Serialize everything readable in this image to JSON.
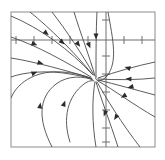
{
  "figure": {
    "caption": "",
    "background_color": "#ffffff",
    "line_color": "#4a4a4a",
    "axis_color": "#6e6e6e",
    "frame_color": "#8c8c8c"
  },
  "chart_data": {
    "type": "line",
    "subtitle": "",
    "xlabel": "",
    "ylabel": "",
    "xlim": [
      -5,
      4
    ],
    "ylim": [
      -6,
      2
    ],
    "grid": false,
    "legend": null,
    "legend_position": "none",
    "tick_labels_x": [],
    "tick_labels_y": [],
    "axes": {
      "x_axis_y_value": 0,
      "y_axis_x_value": 0,
      "x_tick_spacing": 1,
      "y_tick_spacing": 1,
      "x_tick_count": 9,
      "y_tick_count": 8
    },
    "equilibrium_point": {
      "x": -0.75,
      "y": -1.6,
      "classification": "attracting node / spiral"
    },
    "frame": {
      "left_px": 11,
      "top_px": 12,
      "right_px": 155,
      "bottom_px": 147
    },
    "axis_pixels": {
      "x_axis_y_px": 40,
      "y_axis_x_px": 106,
      "x_ticks_px": [
        16,
        34,
        52,
        70,
        88,
        124,
        142
      ],
      "y_ticks_px": [
        20,
        56,
        74,
        92,
        110,
        128,
        142
      ]
    },
    "series": [
      {
        "name": "trajectory-1",
        "path_px": "M 11,16 C 40,28 70,50 92,74",
        "arrows_px": [
          [
            46,
            33,
            40
          ]
        ]
      },
      {
        "name": "trajectory-2",
        "path_px": "M 30,12 C 50,28 74,52 93,75",
        "arrows_px": [
          [
            62,
            42,
            42
          ]
        ]
      },
      {
        "name": "trajectory-3",
        "path_px": "M 52,12 C 66,30 82,54 94,75",
        "arrows_px": [
          [
            78,
            44,
            52
          ]
        ]
      },
      {
        "name": "trajectory-4",
        "path_px": "M 74,12 C 80,32 90,58 95,76",
        "arrows_px": [
          [
            89,
            45,
            68
          ]
        ]
      },
      {
        "name": "trajectory-5",
        "path_px": "M 97,12 C 96,30 96,56 96,77",
        "arrows_px": [
          [
            96,
            36,
            90
          ]
        ]
      },
      {
        "name": "trajectory-6",
        "path_px": "M 108,12 C 113,40 118,62 107,76 C 100,84 94,80 96,77",
        "arrows_px": []
      },
      {
        "name": "trajectory-7",
        "path_px": "M 155,62 C 136,66 115,72 98,78",
        "arrows_px": [
          [
            128,
            68,
            197
          ]
        ]
      },
      {
        "name": "trajectory-8",
        "path_px": "M 155,78 C 138,80 116,80 98,79",
        "arrows_px": [
          [
            129,
            79,
            183
          ]
        ]
      },
      {
        "name": "trajectory-9",
        "path_px": "M 155,95 C 136,90 115,84 98,80",
        "arrows_px": [
          [
            131,
            87,
            166
          ]
        ]
      },
      {
        "name": "trajectory-10",
        "path_px": "M 155,117 C 134,105 114,90 98,81",
        "arrows_px": [
          [
            124,
            96,
            149
          ]
        ]
      },
      {
        "name": "trajectory-11",
        "path_px": "M 140,147 C 122,124 106,98 97,82",
        "arrows_px": [
          [
            116,
            117,
            123
          ]
        ]
      },
      {
        "name": "trajectory-12",
        "path_px": "M 118,147 C 110,122 100,96 96,82",
        "arrows_px": [
          [
            105,
            113,
            110
          ]
        ]
      },
      {
        "name": "trajectory-13",
        "path_px": "M 96,147 C 92,124 92,98 95,82",
        "arrows_px": []
      },
      {
        "name": "trajectory-14",
        "path_px": "M 70,142 C 62,118 68,96 84,84 C 88,81 92,80 94,81",
        "arrows_px": [
          [
            64,
            104,
            290
          ]
        ]
      },
      {
        "name": "trajectory-15",
        "path_px": "M 52,147 C 38,120 38,98 56,84 C 68,75 84,76 93,80",
        "arrows_px": [
          [
            40,
            106,
            278
          ]
        ]
      },
      {
        "name": "trajectory-16",
        "path_px": "M 11,98 C 18,80 40,70 62,72 C 78,73 88,77 92,79",
        "arrows_px": [
          [
            34,
            73,
            340
          ]
        ]
      },
      {
        "name": "trajectory-17",
        "path_px": "M 11,58 C 36,62 64,70 91,78",
        "arrows_px": [
          [
            40,
            63,
            16
          ]
        ]
      },
      {
        "name": "trajectory-18",
        "path_px": "M 11,37 C 38,46 66,62 91,77",
        "arrows_px": [
          [
            34,
            44,
            22
          ]
        ]
      },
      {
        "name": "trajectory-19",
        "path_px": "M 11,77 C 24,72 48,70 70,74 C 82,76 89,78 92,79",
        "arrows_px": []
      }
    ]
  },
  "a11y": {
    "figure_role_label": "phase portrait plot",
    "description": "Phase plane diagram with a horizontal and vertical axis crossing near the upper right; many smooth trajectory curves with small triangular arrowheads converge toward a single equilibrium point just left of and below the axis crossing."
  }
}
